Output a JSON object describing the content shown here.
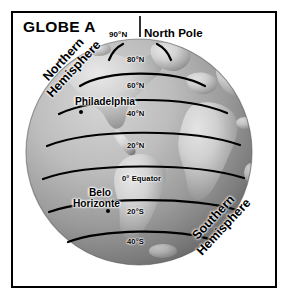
{
  "figure": {
    "title": "GLOBE A",
    "kind": "globe-diagram"
  },
  "pole": {
    "lat_label": "90°N",
    "name": "North Pole"
  },
  "hemispheres": {
    "northern_line1": "Northern",
    "northern_line2": "Hemisphere",
    "southern_line1": "Southern",
    "southern_line2": "Hemisphere"
  },
  "latitudes": [
    {
      "label": "80°N",
      "value": 80,
      "hemisphere": "N"
    },
    {
      "label": "60°N",
      "value": 60,
      "hemisphere": "N"
    },
    {
      "label": "40°N",
      "value": 40,
      "hemisphere": "N"
    },
    {
      "label": "20°N",
      "value": 20,
      "hemisphere": "N"
    },
    {
      "label": "0° Equator",
      "value": 0,
      "hemisphere": ""
    },
    {
      "label": "20°S",
      "value": -20,
      "hemisphere": "S"
    },
    {
      "label": "40°S",
      "value": -40,
      "hemisphere": "S"
    }
  ],
  "cities": [
    {
      "name_line1": "Philadelphia",
      "name_line2": "",
      "latitude": 40,
      "hemisphere": "N"
    },
    {
      "name_line1": "Belo",
      "name_line2": "Horizonte",
      "latitude": -20,
      "hemisphere": "S"
    }
  ],
  "colors": {
    "frame_border": "#000000",
    "background": "#ffffff",
    "ocean_light": "#b9b9b9",
    "ocean_dark": "#6f6f6f",
    "land_light": "#d8d8d8",
    "land_dark": "#8d8d8d",
    "grid_line": "#000000",
    "text": "#000000"
  }
}
